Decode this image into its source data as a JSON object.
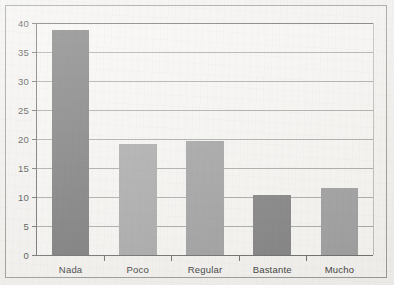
{
  "chart_data": {
    "type": "bar",
    "title": "",
    "subtitle": "",
    "xlabel": "",
    "ylabel": "",
    "categories": [
      "Nada",
      "Poco",
      "Regular",
      "Bastante",
      "Mucho"
    ],
    "values": [
      38.8,
      19.2,
      19.6,
      10.3,
      11.6
    ],
    "series": [
      {
        "name": "",
        "values": [
          38.8,
          19.2,
          19.6,
          10.3,
          11.6
        ]
      }
    ],
    "ylim": [
      0,
      40
    ],
    "yticks": [
      0,
      5,
      10,
      15,
      20,
      25,
      30,
      35,
      40
    ],
    "ytick_labels": [
      "0",
      "5",
      "10",
      "15",
      "20",
      "25",
      "30",
      "35",
      "40"
    ],
    "xtick_labels": [
      "Nada",
      "Poco",
      "Regular",
      "Bastante",
      "Mucho"
    ],
    "grid": true,
    "grid_axis": "y",
    "legend": false,
    "legend_position": "none",
    "annotations": [],
    "bar_colors": [
      "#797979",
      "#a9a9a9",
      "#a0a0a0",
      "#828282",
      "#9e9e9e"
    ],
    "colors": {
      "plot_background": "#f7f6f3",
      "figure_background": "#f2f1ee",
      "frame_border": "#9a9a96",
      "axis_line": "#6e6e6c",
      "gridline": "#a9a9a6",
      "tick_label": "#4a4a48"
    }
  }
}
